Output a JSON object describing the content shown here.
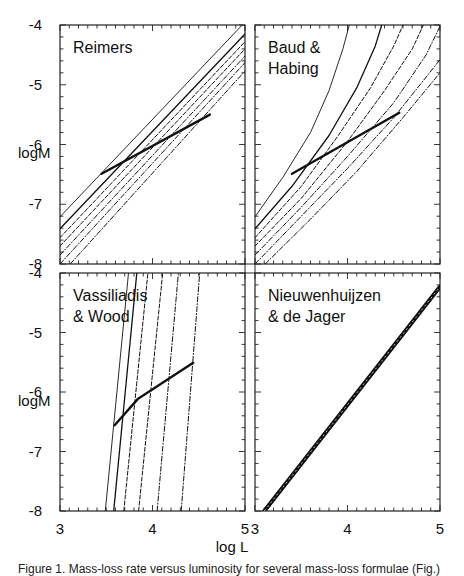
{
  "figure": {
    "x_axis_title": "log L",
    "y_axis_title": "logM",
    "caption_fragment": "Figure 1. Mass-loss rate versus luminosity for several mass-loss formulae (Fig.)"
  },
  "chart_data": {
    "type": "line",
    "layout": "2x2 panel grid with shared axes",
    "xlabel": "log L",
    "ylabel": "logM",
    "xlim": [
      3,
      5
    ],
    "ylim": [
      -8,
      -4
    ],
    "x_ticks": [
      3,
      4,
      5
    ],
    "y_ticks": [
      -4,
      -5,
      -6,
      -7,
      -8
    ],
    "x_minor_step": 0.1,
    "y_minor_step": 0.2,
    "grid": false,
    "panels": [
      {
        "id": "reimers",
        "label": "Reimers",
        "position": "top-left",
        "series": [
          {
            "name": "track 1",
            "style": "thin",
            "x": [
              3.0,
              4.97
            ],
            "y": [
              -7.21,
              -4.0
            ]
          },
          {
            "name": "track 2",
            "style": "solid",
            "x": [
              3.0,
              5.0
            ],
            "y": [
              -7.41,
              -4.15
            ]
          },
          {
            "name": "track 3",
            "style": "dashed",
            "x": [
              3.0,
              5.0
            ],
            "y": [
              -7.56,
              -4.28
            ]
          },
          {
            "name": "track 4",
            "style": "dashed",
            "x": [
              3.0,
              5.0
            ],
            "y": [
              -7.7,
              -4.4
            ]
          },
          {
            "name": "track 5",
            "style": "dashdot",
            "x": [
              3.0,
              5.0
            ],
            "y": [
              -7.85,
              -4.52
            ]
          },
          {
            "name": "track 6",
            "style": "dashdot",
            "x": [
              3.0,
              5.0
            ],
            "y": [
              -8.0,
              -4.63
            ]
          },
          {
            "name": "track 7",
            "style": "dashdot",
            "x": [
              3.11,
              5.0
            ],
            "y": [
              -8.0,
              -4.77
            ]
          },
          {
            "name": "locus",
            "style": "bold",
            "x": [
              3.45,
              4.62
            ],
            "y": [
              -6.49,
              -5.5
            ]
          }
        ]
      },
      {
        "id": "baud-habing",
        "label": "Baud & Habing",
        "position": "top-right",
        "series": [
          {
            "name": "track 1",
            "style": "thin",
            "x": [
              3.0,
              3.3,
              3.6,
              3.8,
              3.95,
              4.02
            ],
            "y": [
              -7.21,
              -6.55,
              -5.8,
              -5.1,
              -4.4,
              -4.0
            ]
          },
          {
            "name": "track 2",
            "style": "solid",
            "x": [
              3.0,
              3.4,
              3.8,
              4.1,
              4.3,
              4.37
            ],
            "y": [
              -7.41,
              -6.7,
              -5.85,
              -5.05,
              -4.35,
              -4.0
            ]
          },
          {
            "name": "track 3",
            "style": "dashed",
            "x": [
              3.0,
              3.5,
              3.9,
              4.25,
              4.5,
              4.6
            ],
            "y": [
              -7.56,
              -6.7,
              -5.85,
              -5.05,
              -4.35,
              -4.0
            ]
          },
          {
            "name": "track 4",
            "style": "dashed",
            "x": [
              3.0,
              3.5,
              4.0,
              4.4,
              4.7,
              4.82
            ],
            "y": [
              -7.7,
              -6.9,
              -5.95,
              -5.1,
              -4.4,
              -4.0
            ]
          },
          {
            "name": "track 5",
            "style": "dashdot",
            "x": [
              3.0,
              3.5,
              4.0,
              4.5,
              4.85,
              5.0
            ],
            "y": [
              -7.85,
              -7.05,
              -6.2,
              -5.3,
              -4.5,
              -4.02
            ]
          },
          {
            "name": "track 6",
            "style": "dashdot",
            "x": [
              3.0,
              3.5,
              4.0,
              4.5,
              5.0
            ],
            "y": [
              -8.0,
              -7.2,
              -6.4,
              -5.55,
              -4.58
            ]
          },
          {
            "name": "track 7",
            "style": "dashdot",
            "x": [
              3.11,
              3.6,
              4.1,
              4.6,
              5.0
            ],
            "y": [
              -8.0,
              -7.25,
              -6.45,
              -5.55,
              -4.8
            ]
          },
          {
            "name": "locus",
            "style": "bold",
            "x": [
              3.4,
              4.56
            ],
            "y": [
              -6.49,
              -5.47
            ]
          }
        ]
      },
      {
        "id": "vassiliadis-wood",
        "label": "Vassiliadis & Wood",
        "position": "bottom-left",
        "series": [
          {
            "name": "track 1",
            "style": "thin",
            "x": [
              3.49,
              3.74
            ],
            "y": [
              -8.0,
              -4.0
            ]
          },
          {
            "name": "track 2",
            "style": "solid",
            "x": [
              3.58,
              3.83
            ],
            "y": [
              -8.0,
              -4.0
            ]
          },
          {
            "name": "track 3",
            "style": "dashed",
            "x": [
              3.69,
              3.95
            ],
            "y": [
              -8.0,
              -4.0
            ]
          },
          {
            "name": "track 4",
            "style": "dashed",
            "x": [
              3.85,
              4.11
            ],
            "y": [
              -8.0,
              -4.0
            ]
          },
          {
            "name": "track 5",
            "style": "dashdot",
            "x": [
              4.05,
              4.28
            ],
            "y": [
              -8.0,
              -4.0
            ]
          },
          {
            "name": "track 6",
            "style": "dashdot",
            "x": [
              4.31,
              4.51
            ],
            "y": [
              -8.0,
              -4.0
            ]
          },
          {
            "name": "locus",
            "style": "bold",
            "x": [
              3.59,
              3.84,
              4.44
            ],
            "y": [
              -6.56,
              -6.12,
              -5.51
            ]
          }
        ]
      },
      {
        "id": "nieuwenhuijzen-de-jager",
        "label": "Nieuwenhuijzen & de Jager",
        "position": "bottom-right",
        "series": [
          {
            "name": "all tracks (overlapping)",
            "style": "thick-overlap",
            "x": [
              3.1,
              5.0
            ],
            "y": [
              -8.0,
              -4.23
            ]
          }
        ]
      }
    ]
  }
}
